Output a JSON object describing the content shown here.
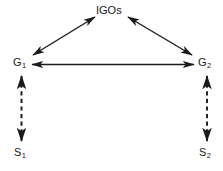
{
  "diagram": {
    "type": "node-link-diagram",
    "background_color": "#ffffff",
    "line_color": "#1a1a1a",
    "nodes": [
      {
        "id": "igos",
        "label": "IGOs",
        "sub": "",
        "x": 111,
        "y": 11
      },
      {
        "id": "g1",
        "label": "G",
        "sub": "1",
        "x": 22,
        "y": 63
      },
      {
        "id": "g2",
        "label": "G",
        "sub": "2",
        "x": 205,
        "y": 63
      },
      {
        "id": "s1",
        "label": "S",
        "sub": "1",
        "x": 22,
        "y": 153
      },
      {
        "id": "s2",
        "label": "S",
        "sub": "2",
        "x": 207,
        "y": 153
      }
    ],
    "edges": [
      {
        "id": "g1-igos",
        "from": "g1",
        "to": "igos",
        "style": "solid",
        "arrows": "both"
      },
      {
        "id": "igos-g2",
        "from": "igos",
        "to": "g2",
        "style": "solid",
        "arrows": "both"
      },
      {
        "id": "g1-g2",
        "from": "g1",
        "to": "g2",
        "style": "solid",
        "arrows": "both"
      },
      {
        "id": "g1-s1",
        "from": "g1",
        "to": "s1",
        "style": "dashed",
        "arrows": "both"
      },
      {
        "id": "g2-s2",
        "from": "g2",
        "to": "s2",
        "style": "dashed",
        "arrows": "both"
      }
    ]
  }
}
